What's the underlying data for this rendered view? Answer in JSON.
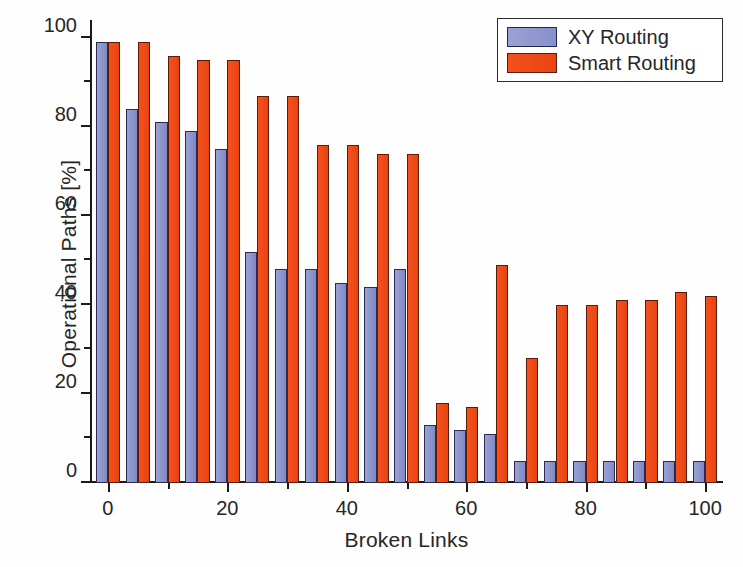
{
  "chart_data": {
    "type": "bar",
    "title": "",
    "xlabel": "Broken Links",
    "ylabel": "Operational Paths [%]",
    "xlim": [
      -3,
      103
    ],
    "ylim": [
      0,
      104
    ],
    "grid": false,
    "legend_position": "top-right",
    "x": [
      0,
      5,
      10,
      15,
      20,
      25,
      30,
      35,
      40,
      45,
      50,
      55,
      60,
      65,
      70,
      75,
      80,
      85,
      90,
      95,
      100
    ],
    "categories": [
      "0",
      "5",
      "10",
      "15",
      "20",
      "25",
      "30",
      "35",
      "40",
      "45",
      "50",
      "55",
      "60",
      "65",
      "70",
      "75",
      "80",
      "85",
      "90",
      "95",
      "100"
    ],
    "series": [
      {
        "name": "XY Routing",
        "color": "#8e97cd",
        "values": [
          99,
          84,
          81,
          79,
          75,
          52,
          48,
          48,
          45,
          44,
          48,
          13,
          12,
          11,
          5,
          5,
          5,
          5,
          5,
          5,
          5
        ]
      },
      {
        "name": "Smart Routing",
        "color": "#ef4a18",
        "values": [
          99,
          99,
          96,
          95,
          95,
          87,
          87,
          76,
          76,
          74,
          74,
          18,
          17,
          49,
          28,
          40,
          40,
          41,
          41,
          43,
          42
        ]
      }
    ],
    "xticks_major": [
      0,
      20,
      40,
      60,
      80,
      100
    ],
    "xticks_minor": [
      10,
      30,
      50,
      70,
      90
    ],
    "xtick_labels": [
      "0",
      "20",
      "40",
      "60",
      "80",
      "100"
    ],
    "yticks_major": [
      0,
      20,
      40,
      60,
      80,
      100
    ],
    "yticks_minor": [
      10,
      30,
      50,
      70,
      90
    ],
    "ytick_labels": [
      "0",
      "20",
      "40",
      "60",
      "80",
      "100"
    ]
  },
  "legend": {
    "items": [
      {
        "label": "XY Routing",
        "color": "#8e97cd"
      },
      {
        "label": "Smart Routing",
        "color": "#ef4a18"
      }
    ]
  }
}
